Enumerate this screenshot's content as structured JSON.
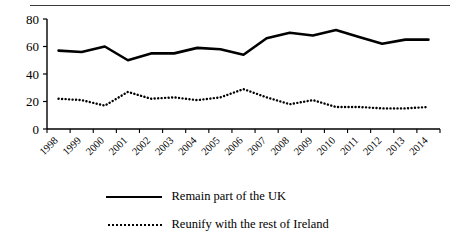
{
  "chart_data": {
    "type": "line",
    "title": "",
    "xlabel": "",
    "ylabel": "",
    "ylim": [
      0,
      80
    ],
    "yticks": [
      0,
      20,
      40,
      60,
      80
    ],
    "grid": false,
    "legend_position": "below",
    "categories": [
      "1998",
      "1999",
      "2000",
      "2001",
      "2002",
      "2003",
      "2004",
      "2005",
      "2006",
      "2007",
      "2008",
      "2009",
      "2010",
      "2011",
      "2012",
      "2013",
      "2014"
    ],
    "series": [
      {
        "name": "Remain part of the UK",
        "style": "solid",
        "color": "#000000",
        "values": [
          57,
          56,
          60,
          50,
          55,
          55,
          59,
          58,
          54,
          66,
          70,
          68,
          72,
          67,
          62,
          65,
          65
        ]
      },
      {
        "name": "Reunify with the rest of Ireland",
        "style": "dotted",
        "color": "#000000",
        "values": [
          22,
          21,
          17,
          27,
          22,
          23,
          21,
          23,
          29,
          23,
          18,
          21,
          16,
          16,
          15,
          15,
          16
        ]
      }
    ]
  },
  "axis": {
    "y_tick_labels": [
      "80",
      "60",
      "40",
      "20",
      "0"
    ],
    "x_tick_labels": [
      "1998",
      "1999",
      "2000",
      "2001",
      "2002",
      "2003",
      "2004",
      "2005",
      "2006",
      "2007",
      "2008",
      "2009",
      "2010",
      "2011",
      "2012",
      "2013",
      "2014"
    ]
  },
  "legend": {
    "entries": [
      {
        "label": "Remain part of the UK",
        "style": "solid"
      },
      {
        "label": "Reunify with the rest of Ireland",
        "style": "dotted"
      }
    ]
  },
  "colors": {
    "line": "#000000",
    "axis": "#000000",
    "rule": "#3a3a3a",
    "background": "#ffffff"
  }
}
